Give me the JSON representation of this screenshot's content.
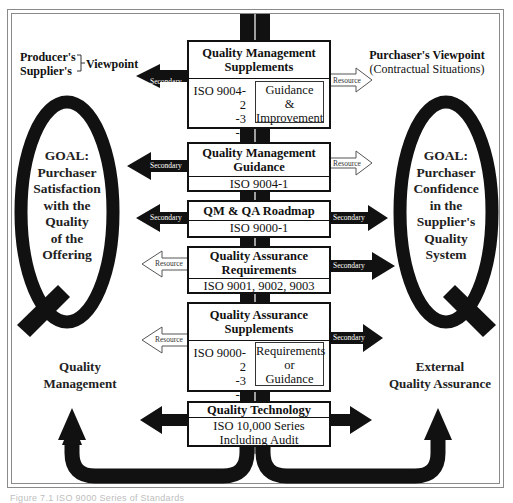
{
  "diagram": {
    "viewpoints": {
      "producer": {
        "line1": "Producer's",
        "line2": "Supplier's",
        "label": "Viewpoint"
      },
      "purchaser": {
        "title": "Purchaser's Viewpoint",
        "subtitle": "(Contractual Situations)"
      }
    },
    "goals": {
      "left": [
        "GOAL:",
        "Purchaser",
        "Satisfaction",
        "with the",
        "Quality",
        "of the",
        "Offering"
      ],
      "right": [
        "GOAL:",
        "Purchaser",
        "Confidence",
        "in the",
        "Supplier's",
        "Quality",
        "System"
      ]
    },
    "bottom_labels": {
      "left": [
        "Quality",
        "Management"
      ],
      "right": [
        "External",
        "Quality Assurance"
      ]
    },
    "boxes": [
      {
        "id": "qm-supplements",
        "title": [
          "Quality Management",
          "Supplements"
        ],
        "iso": [
          "ISO 9004-2",
          "-3",
          "-4"
        ],
        "inner": [
          "Guidance",
          "&",
          "Improvement"
        ],
        "left_arrow": "Secondary",
        "right_arrow": "Resource"
      },
      {
        "id": "qm-guidance",
        "title": [
          "Quality Management",
          "Guidance"
        ],
        "sub": "ISO 9004-1",
        "left_arrow": "Secondary",
        "right_arrow": "Resource"
      },
      {
        "id": "qm-qa-roadmap",
        "title": [
          "QM & QA Roadmap"
        ],
        "sub": "ISO 9000-1",
        "left_arrow": "Secondary",
        "right_arrow": "Secondary"
      },
      {
        "id": "qa-requirements",
        "title": [
          "Quality Assurance",
          "Requirements"
        ],
        "sub": "ISO 9001, 9002, 9003",
        "left_arrow": "Resource",
        "right_arrow": "Secondary"
      },
      {
        "id": "qa-supplements",
        "title": [
          "Quality Assurance",
          "Supplements"
        ],
        "iso": [
          "ISO 9000-2",
          "-3",
          "-4"
        ],
        "inner": [
          "Requirements",
          "or",
          "Guidance"
        ],
        "left_arrow": "Resource",
        "right_arrow": "Secondary"
      },
      {
        "id": "quality-technology",
        "title": [
          "Quality Technology"
        ],
        "sub_lines": [
          "ISO 10,000 Series",
          "Including Audit"
        ]
      }
    ],
    "caption": "Figure 7.1  ISO 9000 Series of Standards"
  }
}
